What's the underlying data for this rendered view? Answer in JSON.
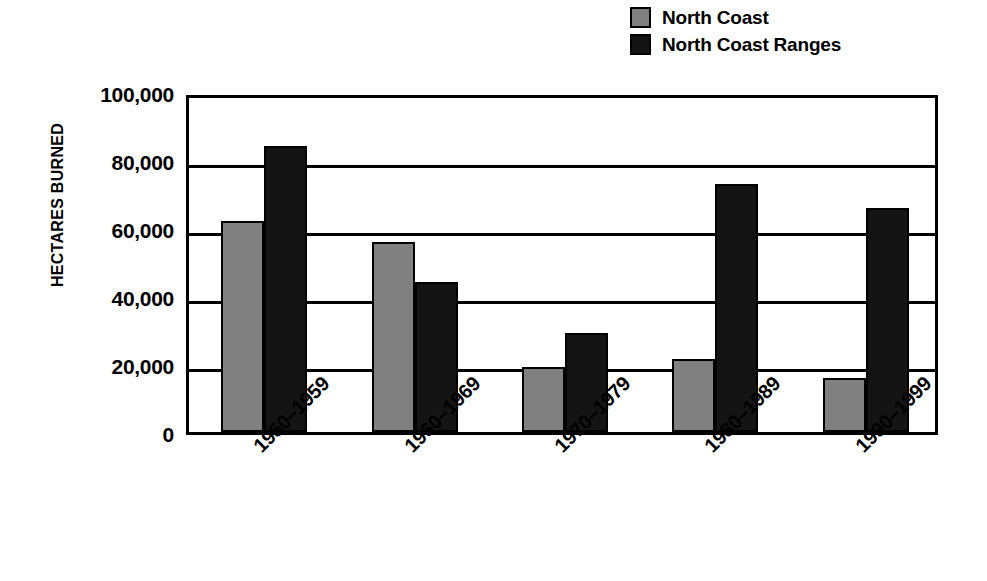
{
  "chart_data": {
    "type": "bar",
    "title": "",
    "xlabel": "",
    "ylabel": "HECTARES BURNED",
    "categories": [
      "1950–1959",
      "1960–1969",
      "1970–1979",
      "1980–1989",
      "1990–1999"
    ],
    "series": [
      {
        "name": "North Coast",
        "color": "#808080",
        "values": [
          62000,
          56000,
          19000,
          21500,
          16000
        ]
      },
      {
        "name": "North Coast Ranges",
        "color": "#141414",
        "values": [
          84000,
          44000,
          29000,
          73000,
          66000
        ]
      }
    ],
    "ylim": [
      0,
      100000
    ],
    "ytick_values": [
      0,
      20000,
      40000,
      60000,
      80000,
      100000
    ],
    "ytick_labels": [
      "0",
      "20,000",
      "40,000",
      "60,000",
      "80,000",
      "100,000"
    ],
    "grid": true,
    "grid_axis": "y",
    "legend_position": "top-right",
    "xtick_rotation": 45
  },
  "legend": {
    "items": [
      {
        "label": "North Coast",
        "swatch": "gray",
        "icon": "legend-swatch-icon"
      },
      {
        "label": "North Coast Ranges",
        "swatch": "black",
        "icon": "legend-swatch-icon"
      }
    ]
  }
}
